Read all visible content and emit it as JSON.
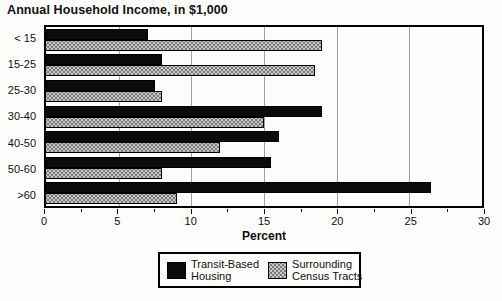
{
  "chart_data": {
    "type": "bar",
    "orientation": "horizontal",
    "title": "Annual Household Income, in $1,000",
    "xlabel": "Percent",
    "ylabel": "",
    "categories": [
      "< 15",
      "15-25",
      "25-30",
      "30-40",
      "40-50",
      "50-60",
      ">60"
    ],
    "series": [
      {
        "name": "Transit-Based Housing",
        "color": "#0b0b0b",
        "pattern": "solid-black",
        "values": [
          7,
          8,
          7.5,
          19,
          16,
          15.5,
          26.5
        ]
      },
      {
        "name": "Surrounding Census Tracts",
        "color": "#c6c6c6",
        "pattern": "gray-halftone",
        "values": [
          19,
          18.5,
          8,
          15,
          12,
          8,
          9
        ]
      }
    ],
    "xlim": [
      0,
      30
    ],
    "xticks": [
      0,
      5,
      10,
      15,
      20,
      25,
      30
    ],
    "minor_tick_step": 2.5,
    "grid": true,
    "legend_position": "bottom",
    "legend": {
      "items": [
        {
          "lines": [
            "Transit-Based",
            "Housing"
          ],
          "swatch": "black-solid"
        },
        {
          "lines": [
            "Surrounding",
            "Census Tracts"
          ],
          "swatch": "gray-halftone"
        }
      ]
    }
  }
}
